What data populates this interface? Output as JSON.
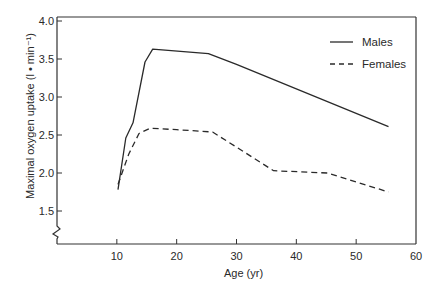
{
  "chart_data": {
    "type": "line",
    "title": "",
    "xlabel": "Age (yr)",
    "ylabel": "Maximal oxygen uptake (l • min⁻¹)",
    "xlim": [
      0,
      60
    ],
    "ylim": [
      1.1,
      4.0
    ],
    "xticks": [
      10,
      20,
      30,
      40,
      50,
      60
    ],
    "xtick_labels": [
      "10",
      "20",
      "30",
      "40",
      "50",
      "60"
    ],
    "yticks": [
      1.5,
      2.0,
      2.5,
      3.0,
      3.5,
      4.0
    ],
    "ytick_labels": [
      "1.5",
      "2.0",
      "2.5",
      "3.0",
      "3.5",
      "4.0"
    ],
    "y_axis_break": true,
    "grid": false,
    "legend_position": "top-right",
    "series": [
      {
        "name": "Males",
        "style": "solid",
        "x": [
          10.2,
          11.5,
          12.7,
          14.7,
          16,
          25.3,
          30,
          55.4
        ],
        "y": [
          1.78,
          2.46,
          2.66,
          3.46,
          3.63,
          3.57,
          3.43,
          2.61
        ]
      },
      {
        "name": "Females",
        "style": "dashed",
        "x": [
          10.2,
          12,
          13.7,
          15.6,
          20,
          26,
          36.2,
          45.2,
          55.4
        ],
        "y": [
          1.85,
          2.25,
          2.52,
          2.59,
          2.57,
          2.54,
          2.03,
          2.0,
          1.75
        ]
      }
    ]
  }
}
